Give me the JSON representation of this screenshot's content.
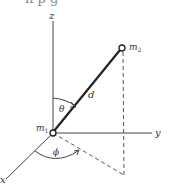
{
  "figure": {
    "top_text_fragment": "n p g",
    "axes": {
      "x_label": "x",
      "y_label": "y",
      "z_label": "z"
    },
    "masses": {
      "m1": {
        "label": "m",
        "subscript": "1"
      },
      "m2": {
        "label": "m",
        "subscript": "2"
      }
    },
    "distance_label": "d",
    "polar_angle_label": "θ",
    "azimuthal_angle_label": "ϕ",
    "colors": {
      "line": "#333333",
      "dashed": "#555555",
      "background": "#ffffff"
    }
  }
}
